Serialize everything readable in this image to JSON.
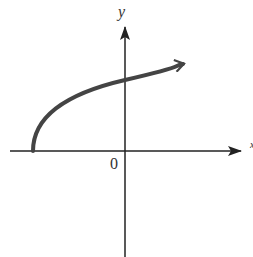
{
  "diagram": {
    "type": "function graph (square-root curve)",
    "axes": {
      "x_label": "x",
      "y_label": "y",
      "origin_label": "0"
    },
    "curve": {
      "description": "Curve starting on the negative x-axis, rising and concave down, crossing the positive y-axis and continuing right with an arrowhead",
      "color": "#444444"
    },
    "colors": {
      "axis": "#222222",
      "curve": "#444444",
      "background": "#ffffff"
    }
  }
}
